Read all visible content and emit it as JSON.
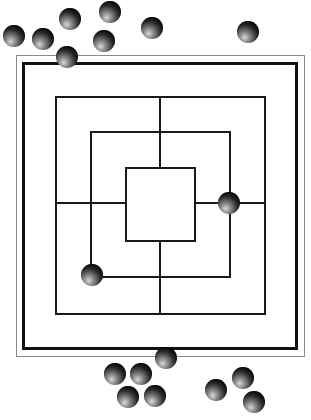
{
  "game": {
    "name": "Nine Men's Morris",
    "colors": {
      "lines": "#1a1a1a",
      "outer_frame": "#8a8a8a",
      "thick_frame": "#111111",
      "piece": "#111111",
      "background": "#ffffff"
    },
    "board": {
      "outer_frame": {
        "x": 16,
        "y": 55,
        "w": 289,
        "h": 302
      },
      "thick_frame": {
        "x": 22,
        "y": 62,
        "w": 276,
        "h": 288
      },
      "squares": [
        {
          "name": "outer",
          "x": 55,
          "y": 96,
          "w": 211,
          "h": 219
        },
        {
          "name": "middle",
          "x": 90,
          "y": 131,
          "w": 141,
          "h": 147
        },
        {
          "name": "inner",
          "x": 125,
          "y": 167,
          "w": 71,
          "h": 75
        }
      ],
      "center": {
        "x": 160,
        "y": 203
      }
    },
    "pieces_on_board": [
      {
        "x": 229,
        "y": 203,
        "point": "middle-right"
      },
      {
        "x": 92,
        "y": 275,
        "point": "middle-bottom-left"
      },
      {
        "x": 67,
        "y": 57,
        "point": "off-board-top-edge"
      }
    ],
    "pieces_reserve_top": [
      {
        "x": 14,
        "y": 36
      },
      {
        "x": 43,
        "y": 39
      },
      {
        "x": 70,
        "y": 19
      },
      {
        "x": 110,
        "y": 12
      },
      {
        "x": 104,
        "y": 41
      },
      {
        "x": 152,
        "y": 28
      },
      {
        "x": 248,
        "y": 32
      }
    ],
    "pieces_reserve_bottom": [
      {
        "x": 166,
        "y": 358
      },
      {
        "x": 115,
        "y": 374
      },
      {
        "x": 141,
        "y": 374
      },
      {
        "x": 128,
        "y": 397
      },
      {
        "x": 155,
        "y": 396
      },
      {
        "x": 216,
        "y": 390
      },
      {
        "x": 243,
        "y": 378
      },
      {
        "x": 254,
        "y": 402
      }
    ]
  },
  "caption": {
    "text": ""
  }
}
